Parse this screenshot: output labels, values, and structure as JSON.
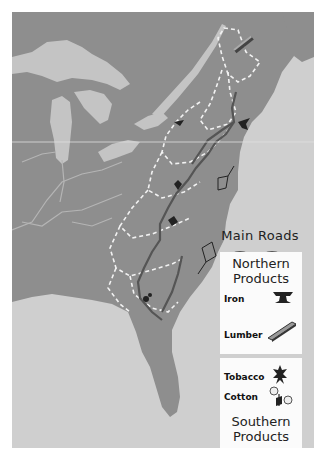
{
  "map": {
    "title": "Colonial Trade Map",
    "colors": {
      "land": "#8e8e8e",
      "water": "#cfcfcf",
      "lake": "#c4c4c4",
      "road": "#5a5a5a",
      "border": "#f2f2f2"
    }
  },
  "legend": {
    "main_roads_label": "Main Roads",
    "northern": {
      "title_line1": "Northern",
      "title_line2": "Products",
      "items": [
        {
          "label": "Iron",
          "icon": "anvil-icon"
        },
        {
          "label": "Lumber",
          "icon": "lumber-plank-icon"
        }
      ]
    },
    "southern": {
      "title_line1": "Southern",
      "title_line2": "Products",
      "items": [
        {
          "label": "Tobacco",
          "icon": "tobacco-leaf-icon"
        },
        {
          "label": "Cotton",
          "icon": "cotton-plant-icon"
        }
      ]
    }
  }
}
